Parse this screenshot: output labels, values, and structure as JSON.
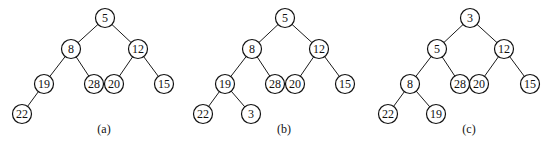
{
  "node_radius": 9.5,
  "trees": [
    {
      "id": "a",
      "caption": "(a)",
      "caption_pos": [
        104,
        133
      ],
      "nodes": [
        {
          "id": "a5",
          "label": "5",
          "x": 105,
          "y": 18
        },
        {
          "id": "a8",
          "label": "8",
          "x": 71,
          "y": 49
        },
        {
          "id": "a12",
          "label": "12",
          "x": 138,
          "y": 49
        },
        {
          "id": "a19",
          "label": "19",
          "x": 44,
          "y": 84
        },
        {
          "id": "a28",
          "label": "28",
          "x": 94,
          "y": 84
        },
        {
          "id": "a20",
          "label": "20",
          "x": 114,
          "y": 84
        },
        {
          "id": "a15",
          "label": "15",
          "x": 164,
          "y": 84
        },
        {
          "id": "a22",
          "label": "22",
          "x": 22,
          "y": 114
        }
      ],
      "edges": [
        [
          "a5",
          "a8"
        ],
        [
          "a5",
          "a12"
        ],
        [
          "a8",
          "a19"
        ],
        [
          "a8",
          "a28"
        ],
        [
          "a12",
          "a20"
        ],
        [
          "a12",
          "a15"
        ],
        [
          "a19",
          "a22"
        ]
      ]
    },
    {
      "id": "b",
      "caption": "(b)",
      "caption_pos": [
        284,
        133
      ],
      "nodes": [
        {
          "id": "b5",
          "label": "5",
          "x": 285,
          "y": 18
        },
        {
          "id": "b8",
          "label": "8",
          "x": 252,
          "y": 49
        },
        {
          "id": "b12",
          "label": "12",
          "x": 319,
          "y": 49
        },
        {
          "id": "b19",
          "label": "19",
          "x": 225,
          "y": 84
        },
        {
          "id": "b28",
          "label": "28",
          "x": 275,
          "y": 84
        },
        {
          "id": "b20",
          "label": "20",
          "x": 295,
          "y": 84
        },
        {
          "id": "b15",
          "label": "15",
          "x": 345,
          "y": 84
        },
        {
          "id": "b22",
          "label": "22",
          "x": 203,
          "y": 114
        },
        {
          "id": "b3",
          "label": "3",
          "x": 251,
          "y": 114
        }
      ],
      "edges": [
        [
          "b5",
          "b8"
        ],
        [
          "b5",
          "b12"
        ],
        [
          "b8",
          "b19"
        ],
        [
          "b8",
          "b28"
        ],
        [
          "b12",
          "b20"
        ],
        [
          "b12",
          "b15"
        ],
        [
          "b19",
          "b22"
        ],
        [
          "b19",
          "b3"
        ]
      ]
    },
    {
      "id": "c",
      "caption": "(c)",
      "caption_pos": [
        469,
        133
      ],
      "nodes": [
        {
          "id": "c3",
          "label": "3",
          "x": 470,
          "y": 18
        },
        {
          "id": "c5",
          "label": "5",
          "x": 437,
          "y": 49
        },
        {
          "id": "c12",
          "label": "12",
          "x": 504,
          "y": 49
        },
        {
          "id": "c8",
          "label": "8",
          "x": 410,
          "y": 84
        },
        {
          "id": "c28",
          "label": "28",
          "x": 460,
          "y": 84
        },
        {
          "id": "c20",
          "label": "20",
          "x": 479,
          "y": 84
        },
        {
          "id": "c15",
          "label": "15",
          "x": 530,
          "y": 84
        },
        {
          "id": "c22",
          "label": "22",
          "x": 388,
          "y": 114
        },
        {
          "id": "c19",
          "label": "19",
          "x": 436,
          "y": 114
        }
      ],
      "edges": [
        [
          "c3",
          "c5"
        ],
        [
          "c3",
          "c12"
        ],
        [
          "c5",
          "c8"
        ],
        [
          "c5",
          "c28"
        ],
        [
          "c12",
          "c20"
        ],
        [
          "c12",
          "c15"
        ],
        [
          "c8",
          "c22"
        ],
        [
          "c8",
          "c19"
        ]
      ]
    }
  ]
}
